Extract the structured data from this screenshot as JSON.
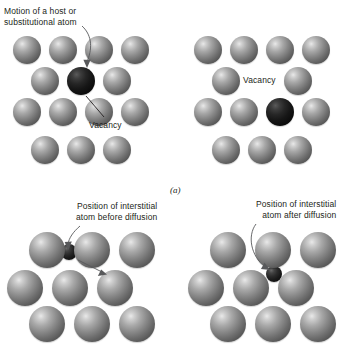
{
  "figure": {
    "subcaption_a": "(a)",
    "background_color": "#ffffff",
    "atom_color": "#8a8a8a",
    "dark_atom_color": "#161616",
    "annotation_color": "#58595b"
  },
  "panels": [
    {
      "id": "top-left",
      "name": "vacancy-diffusion-before",
      "labels": [
        {
          "id": "motion-label",
          "line1": "Motion of a host or",
          "line2": "substitutional atom"
        },
        {
          "id": "vacancy-label",
          "line1": "Vacancy"
        }
      ],
      "atoms": [
        {
          "type": "host",
          "cx": 27,
          "cy": 50,
          "r": 14
        },
        {
          "type": "host",
          "cx": 63,
          "cy": 50,
          "r": 14
        },
        {
          "type": "host",
          "cx": 99,
          "cy": 50,
          "r": 14
        },
        {
          "type": "host",
          "cx": 135,
          "cy": 50,
          "r": 14
        },
        {
          "type": "host",
          "cx": 45,
          "cy": 81,
          "r": 14
        },
        {
          "type": "dark",
          "cx": 81,
          "cy": 81,
          "r": 14
        },
        {
          "type": "host",
          "cx": 117,
          "cy": 81,
          "r": 14
        },
        {
          "type": "host",
          "cx": 27,
          "cy": 112,
          "r": 14
        },
        {
          "type": "host",
          "cx": 63,
          "cy": 112,
          "r": 14
        },
        {
          "type": "host",
          "cx": 99,
          "cy": 112,
          "r": 14
        },
        {
          "type": "host",
          "cx": 135,
          "cy": 112,
          "r": 14
        },
        {
          "type": "host",
          "cx": 45,
          "cy": 150,
          "r": 14
        },
        {
          "type": "host",
          "cx": 81,
          "cy": 150,
          "r": 14
        },
        {
          "type": "host",
          "cx": 117,
          "cy": 150,
          "r": 14
        }
      ]
    },
    {
      "id": "top-right",
      "name": "vacancy-diffusion-after",
      "labels": [
        {
          "id": "vacancy-label",
          "line1": "Vacancy"
        }
      ],
      "atoms": [
        {
          "type": "host",
          "cx": 27,
          "cy": 50,
          "r": 14
        },
        {
          "type": "host",
          "cx": 63,
          "cy": 50,
          "r": 14
        },
        {
          "type": "host",
          "cx": 99,
          "cy": 50,
          "r": 14
        },
        {
          "type": "host",
          "cx": 135,
          "cy": 50,
          "r": 14
        },
        {
          "type": "host",
          "cx": 45,
          "cy": 81,
          "r": 14
        },
        {
          "type": "host",
          "cx": 117,
          "cy": 81,
          "r": 14
        },
        {
          "type": "host",
          "cx": 27,
          "cy": 112,
          "r": 14
        },
        {
          "type": "host",
          "cx": 63,
          "cy": 112,
          "r": 14
        },
        {
          "type": "dark",
          "cx": 99,
          "cy": 112,
          "r": 14
        },
        {
          "type": "host",
          "cx": 135,
          "cy": 112,
          "r": 14
        },
        {
          "type": "host",
          "cx": 45,
          "cy": 150,
          "r": 14
        },
        {
          "type": "host",
          "cx": 81,
          "cy": 150,
          "r": 14
        },
        {
          "type": "host",
          "cx": 117,
          "cy": 150,
          "r": 14
        }
      ]
    },
    {
      "id": "bottom-left",
      "name": "interstitial-diffusion-before",
      "labels": [
        {
          "id": "interstitial-label",
          "line1": "Position of interstitial",
          "line2": "atom before diffusion"
        }
      ],
      "atoms": [
        {
          "type": "host",
          "cx": 47,
          "cy": 60,
          "r": 18
        },
        {
          "type": "host",
          "cx": 92,
          "cy": 60,
          "r": 18
        },
        {
          "type": "host",
          "cx": 137,
          "cy": 60,
          "r": 18
        },
        {
          "type": "small",
          "cx": 69,
          "cy": 62,
          "r": 8
        },
        {
          "type": "host",
          "cx": 25,
          "cy": 98,
          "r": 18
        },
        {
          "type": "host",
          "cx": 70,
          "cy": 98,
          "r": 18
        },
        {
          "type": "host",
          "cx": 115,
          "cy": 98,
          "r": 18
        },
        {
          "type": "host",
          "cx": 47,
          "cy": 134,
          "r": 18
        },
        {
          "type": "host",
          "cx": 92,
          "cy": 134,
          "r": 18
        },
        {
          "type": "host",
          "cx": 137,
          "cy": 134,
          "r": 18
        }
      ]
    },
    {
      "id": "bottom-right",
      "name": "interstitial-diffusion-after",
      "labels": [
        {
          "id": "interstitial-label",
          "line1": "Position of interstitial",
          "line2": "atom after diffusion"
        }
      ],
      "atoms": [
        {
          "type": "host",
          "cx": 47,
          "cy": 60,
          "r": 18
        },
        {
          "type": "host",
          "cx": 92,
          "cy": 60,
          "r": 18
        },
        {
          "type": "host",
          "cx": 137,
          "cy": 60,
          "r": 18
        },
        {
          "type": "host",
          "cx": 25,
          "cy": 98,
          "r": 18
        },
        {
          "type": "host",
          "cx": 70,
          "cy": 98,
          "r": 18
        },
        {
          "type": "host",
          "cx": 115,
          "cy": 98,
          "r": 18
        },
        {
          "type": "small",
          "cx": 93,
          "cy": 84,
          "r": 8
        },
        {
          "type": "host",
          "cx": 47,
          "cy": 134,
          "r": 18
        },
        {
          "type": "host",
          "cx": 92,
          "cy": 134,
          "r": 18
        },
        {
          "type": "host",
          "cx": 137,
          "cy": 134,
          "r": 18
        }
      ]
    }
  ]
}
